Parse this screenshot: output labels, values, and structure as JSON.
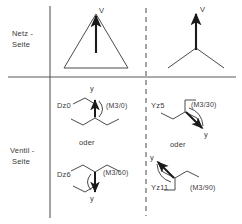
{
  "figure": {
    "row_labels": [
      {
        "id": "netz",
        "text": "Netz -",
        "text2": "Seite"
      },
      {
        "id": "ventil",
        "text": "Ventil -",
        "text2": "Seite"
      }
    ],
    "or_label": "oder",
    "vector_label_delta": "V",
    "vector_label_star": "V",
    "axis_label_y": "y",
    "colors": {
      "line": "#4a4a4a",
      "text": "#3a3a3a",
      "arrow": "#1a1a1a",
      "background": "#ffffff"
    }
  },
  "cells": {
    "top_left": {
      "name": "delta-connection",
      "winding_symbol": "D",
      "vector_label": "V"
    },
    "top_right": {
      "name": "star-connection",
      "winding_symbol": "Y",
      "vector_label": "V"
    },
    "bottom_left": {
      "entries": [
        {
          "code": "Dz0",
          "annotation": "(M3/0)"
        },
        {
          "code": "Dz6",
          "annotation": "(M3/60)"
        }
      ],
      "separator": "oder",
      "axis_label_top": "y",
      "axis_label_bottom": "y"
    },
    "bottom_right": {
      "entries": [
        {
          "code": "Yz5",
          "annotation": "(M3/30)"
        },
        {
          "code": "Yz11",
          "annotation": "(M3/90)"
        }
      ],
      "separator": "oder",
      "axis_label_top": "y",
      "axis_label_bottom": "y"
    }
  }
}
